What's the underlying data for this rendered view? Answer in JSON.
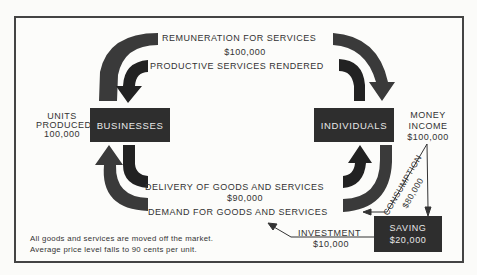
{
  "diagram": {
    "title_top": "REMUNERATION FOR SERVICES",
    "top_amount": "$100,000",
    "productive": "PRODUCTIVE SERVICES RENDERED",
    "delivery": "DELIVERY OF GOODS AND SERVICES",
    "bottom_amount": "$90,000",
    "demand": "DEMAND FOR GOODS AND SERVICES",
    "businesses": "BUSINESSES",
    "individuals": "INDIVIDUALS",
    "units_label_1": "UNITS",
    "units_label_2": "PRODUCED",
    "units_value": "100,000",
    "money_label_1": "MONEY",
    "money_label_2": "INCOME",
    "money_value": "$100,000",
    "consumption_label": "CONSUMPTION",
    "consumption_value": "$80,000",
    "saving_label": "SAVING",
    "saving_value": "$20,000",
    "investment_label": "INVESTMENT",
    "investment_value": "$10,000",
    "note_line_1": "All goods and services are moved off the market.",
    "note_line_2": "Average price level falls to 90 cents per unit.",
    "colors": {
      "box": "#2e2e2e",
      "outer_arrow": "#3a3a3a",
      "inner_arrow": "#222222",
      "frame": "#444444"
    }
  }
}
